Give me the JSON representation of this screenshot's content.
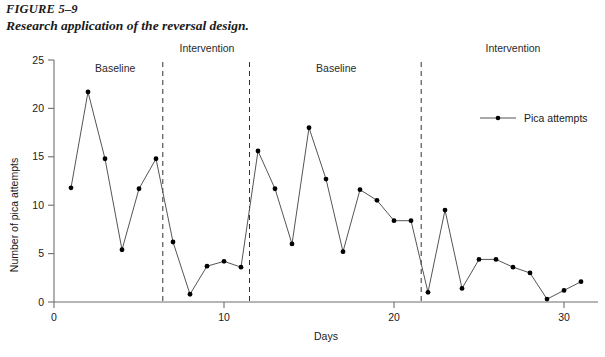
{
  "figure": {
    "number": "FIGURE 5–9",
    "caption": "Research application of the reversal design."
  },
  "chart_data": {
    "type": "line",
    "title": "",
    "xlabel": "Days",
    "ylabel": "Number of pica attempts",
    "xlim": [
      0,
      32
    ],
    "ylim": [
      0,
      25
    ],
    "xticks": [
      0,
      10,
      20,
      30
    ],
    "yticks": [
      0,
      5,
      10,
      15,
      20,
      25
    ],
    "grid": false,
    "legend_position": "right",
    "marker": "filled-circle",
    "line_color": "#555555",
    "marker_color": "#000000",
    "series": [
      {
        "name": "Pica attempts",
        "x": [
          1,
          2,
          3,
          4,
          5,
          6,
          7,
          8,
          9,
          10,
          11,
          12,
          13,
          14,
          15,
          16,
          17,
          18,
          19,
          20,
          21,
          22,
          23,
          24,
          25,
          26,
          27,
          28,
          29,
          30,
          31
        ],
        "values": [
          11.8,
          21.7,
          14.8,
          5.4,
          11.7,
          14.8,
          6.2,
          0.8,
          3.7,
          4.2,
          3.6,
          15.6,
          11.7,
          6.0,
          18.0,
          12.7,
          5.2,
          11.6,
          10.5,
          8.4,
          8.4,
          1.0,
          9.5,
          1.4,
          4.4,
          4.4,
          3.6,
          3.0,
          0.3,
          1.2,
          2.1
        ]
      }
    ],
    "phases": [
      {
        "label": "Baseline",
        "center_x": 3.6
      },
      {
        "label": "Intervention",
        "center_x": 9.0
      },
      {
        "label": "Baseline",
        "center_x": 16.6
      },
      {
        "label": "Intervention",
        "center_x": 27.0
      }
    ],
    "phase_dividers": [
      6.4,
      11.5,
      21.6
    ],
    "annotations": []
  },
  "legend": {
    "entries": [
      {
        "label": "Pica attempts",
        "symbol": "line-with-dot"
      }
    ]
  }
}
